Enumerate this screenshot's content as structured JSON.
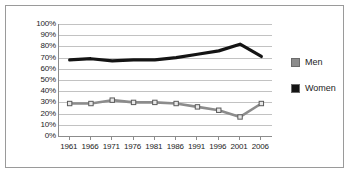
{
  "chart_data": {
    "type": "line",
    "title": "",
    "xlabel": "",
    "ylabel": "",
    "categories": [
      "1961",
      "1966",
      "1971",
      "1976",
      "1981",
      "1986",
      "1991",
      "1996",
      "2001",
      "2006"
    ],
    "ylim": [
      0,
      100
    ],
    "ytick_labels": [
      "100%",
      "90%",
      "80%",
      "70%",
      "60%",
      "50%",
      "40%",
      "30%",
      "20%",
      "10%",
      "0%"
    ],
    "ytick_values": [
      100,
      90,
      80,
      70,
      60,
      50,
      40,
      30,
      20,
      10,
      0
    ],
    "grid": true,
    "legend_position": "right",
    "series": [
      {
        "name": "Men",
        "color": "#8c8c8c",
        "marker": "square",
        "values": [
          29,
          29,
          32,
          30,
          30,
          29,
          26,
          23,
          17,
          29
        ]
      },
      {
        "name": "Women",
        "color": "#141414",
        "marker": "none",
        "values": [
          68,
          69,
          67,
          68,
          68,
          70,
          73,
          76,
          82,
          71
        ]
      }
    ]
  },
  "legend": {
    "items": [
      {
        "label": "Men",
        "color": "#8c8c8c"
      },
      {
        "label": "Women",
        "color": "#141414"
      }
    ]
  }
}
